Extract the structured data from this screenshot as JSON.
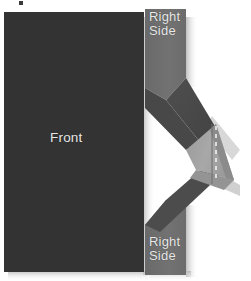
{
  "figure": {
    "type": "diagram",
    "background_color": "#ffffff"
  },
  "colors": {
    "front_panel": "#333333",
    "side_flap": "#6e6e6e",
    "side_flap_dark": "#575757",
    "fold_flap_light": "#a3a3a3",
    "fold_flap_mid": "#8d8d8d",
    "band_dark": "#4a4a4a",
    "label_text": "#e8e8e8",
    "fold_dash": "#f2f2f2",
    "shadow": "#bfbfbf"
  },
  "labels": {
    "front": "Front",
    "right_side_top": "Right\nSide",
    "right_side_bottom": "Right\nSide"
  },
  "parts": [
    {
      "name": "front-panel",
      "label": "Front"
    },
    {
      "name": "right-side-flap-top",
      "label": "Right Side"
    },
    {
      "name": "right-side-flap-bottom",
      "label": "Right Side"
    },
    {
      "name": "fold-band",
      "label": ""
    },
    {
      "name": "fold-crease-line",
      "label": ""
    }
  ]
}
